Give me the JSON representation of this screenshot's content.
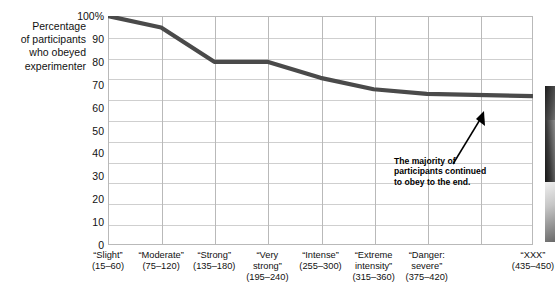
{
  "chart_data": {
    "type": "line",
    "title": "",
    "subtitle": "",
    "xlabel": "",
    "ylabel": "Percentage of participants who obeyed experimenter",
    "ylabel_lines": [
      "Percentage",
      "of participants",
      "who obeyed",
      "experimenter"
    ],
    "categories": [
      "“Slight” (15–60)",
      "“Moderate” (75–120)",
      "“Strong” (135–180)",
      "“Very strong” (195–240)",
      "“Intense” (255–300)",
      "“Extreme intensity” (315–360)",
      "“Danger: severe” (375–420)",
      "“XXX” (435–450)"
    ],
    "category_lines": [
      [
        "“Slight”",
        "(15–60)"
      ],
      [
        "“Moderate”",
        "(75–120)"
      ],
      [
        "“Strong”",
        "(135–180)"
      ],
      [
        "“Very",
        "strong”",
        "(195–240)"
      ],
      [
        "“Intense”",
        "(255–300)"
      ],
      [
        "“Extreme",
        "intensity”",
        "(315–360)"
      ],
      [
        "“Danger:",
        "severe”",
        "(375–420)"
      ],
      [
        "“XXX”",
        "(435–450)"
      ]
    ],
    "values": [
      100,
      95,
      80,
      80,
      73,
      68,
      66,
      65
    ],
    "ylim": [
      0,
      100
    ],
    "ytick_values": [
      0,
      10,
      20,
      30,
      40,
      50,
      60,
      70,
      80,
      90,
      100
    ],
    "ytick_labels": [
      "0",
      "10",
      "20",
      "30",
      "40",
      "50",
      "60",
      "70",
      "80",
      "90",
      "100%"
    ],
    "grid": true,
    "legend": false,
    "series_color": "#4a4a4a",
    "grid_color": "#cfcfcf",
    "frame_color": "#b9b9b9",
    "annotations": [
      {
        "text": "The majority of participants continued to obey to the end.",
        "lines": [
          "The majority of",
          "participants continued",
          "to obey to the end."
        ],
        "arrow": "points up-right to final data point"
      }
    ]
  }
}
